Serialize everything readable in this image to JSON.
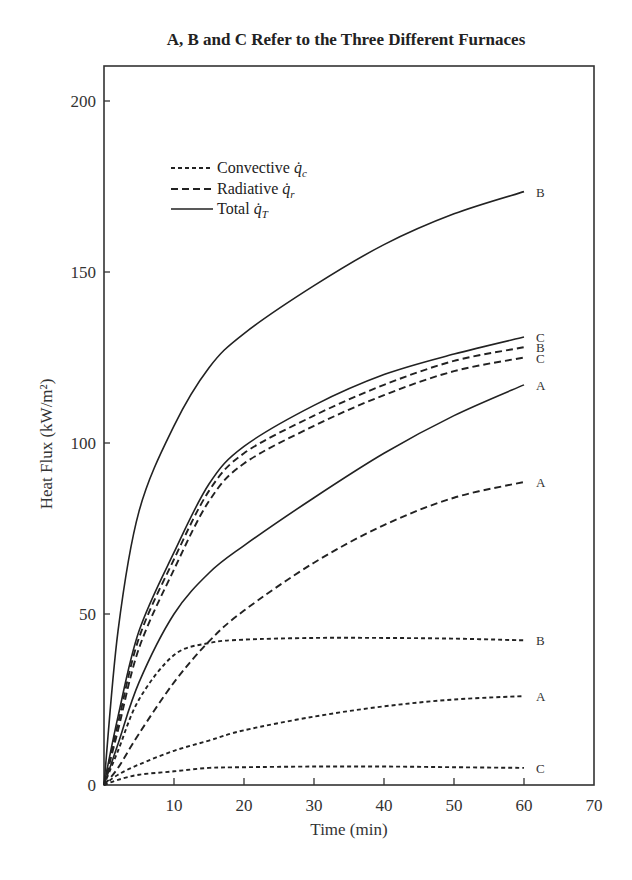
{
  "chart_data": {
    "type": "line",
    "title": "A, B and C Refer to the Three Different Furnaces",
    "xlabel": "Time (min)",
    "ylabel": "Heat Flux (kW/m²)",
    "xlim": [
      0,
      70
    ],
    "ylim": [
      0,
      210
    ],
    "xticks": [
      10,
      20,
      30,
      40,
      50,
      60,
      70
    ],
    "yticks": [
      0,
      50,
      100,
      150,
      200
    ],
    "grid": false,
    "legend_position": "upper left",
    "legend": [
      {
        "label": "Convective",
        "symbol": "q̇c",
        "style": "dotted"
      },
      {
        "label": "Radiative",
        "symbol": "q̇r",
        "style": "dashed"
      },
      {
        "label": "Total",
        "symbol": "q̇T",
        "style": "solid"
      }
    ],
    "x": [
      0,
      2,
      5,
      10,
      15,
      20,
      30,
      40,
      50,
      60
    ],
    "series": [
      {
        "name": "Total B",
        "furnace": "B",
        "kind": "total",
        "style": "solid",
        "end_label": "B",
        "values": [
          0,
          45,
          80,
          105,
          122,
          132,
          146,
          158,
          167,
          173.5
        ]
      },
      {
        "name": "Total C",
        "furnace": "C",
        "kind": "total",
        "style": "solid",
        "end_label": "C",
        "values": [
          0,
          20,
          45,
          68,
          88,
          99,
          111,
          120,
          126,
          131
        ]
      },
      {
        "name": "Radiative B",
        "furnace": "B",
        "kind": "radiative",
        "style": "dashed",
        "end_label": "B",
        "values": [
          0,
          18,
          43,
          66,
          86,
          97,
          108,
          117,
          124,
          128
        ]
      },
      {
        "name": "Radiative C",
        "furnace": "C",
        "kind": "radiative",
        "style": "dashed",
        "end_label": "C",
        "values": [
          0,
          16,
          40,
          63,
          83,
          94,
          105,
          114,
          121,
          125
        ]
      },
      {
        "name": "Total A",
        "furnace": "A",
        "kind": "total",
        "style": "solid",
        "end_label": "A",
        "values": [
          0,
          12,
          30,
          50,
          62,
          70,
          84,
          97,
          108,
          117
        ]
      },
      {
        "name": "Radiative A",
        "furnace": "A",
        "kind": "radiative",
        "style": "dashed",
        "end_label": "A",
        "values": [
          0,
          5,
          15,
          30,
          42,
          51,
          65,
          76,
          84,
          88.6
        ]
      },
      {
        "name": "Convective B",
        "furnace": "B",
        "kind": "convective",
        "style": "dotted",
        "end_label": "B",
        "values": [
          0,
          10,
          25,
          38,
          41.5,
          42.5,
          43,
          43,
          42.8,
          42.3
        ]
      },
      {
        "name": "Convective A",
        "furnace": "A",
        "kind": "convective",
        "style": "dotted",
        "end_label": "A",
        "values": [
          0,
          3,
          6,
          10,
          13,
          16,
          20,
          23,
          25,
          26
        ]
      },
      {
        "name": "Convective C",
        "furnace": "C",
        "kind": "convective",
        "style": "dotted",
        "end_label": "C",
        "values": [
          0,
          1.5,
          3,
          4,
          5,
          5.2,
          5.4,
          5.4,
          5.2,
          5
        ]
      }
    ]
  }
}
